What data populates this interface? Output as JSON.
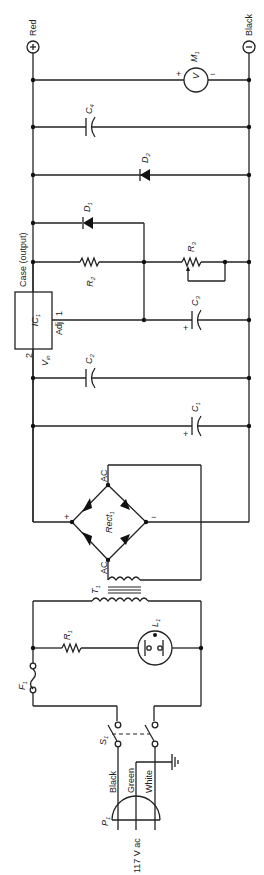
{
  "diagram": {
    "type": "circuit-schematic",
    "orientation": "rotated-90-ccw",
    "terminals": {
      "positive": {
        "symbol": "+",
        "label": "Red"
      },
      "negative": {
        "symbol": "−",
        "label": "Black"
      }
    },
    "components": {
      "M1": {
        "ref": "M",
        "sub": "1",
        "glyph": "V",
        "plus": "+",
        "minus": "−"
      },
      "C4": {
        "ref": "C",
        "sub": "4"
      },
      "D2": {
        "ref": "D",
        "sub": "2"
      },
      "D1": {
        "ref": "D",
        "sub": "1"
      },
      "R2": {
        "ref": "R",
        "sub": "2"
      },
      "R3": {
        "ref": "R",
        "sub": "3"
      },
      "C3": {
        "ref": "C",
        "sub": "3",
        "polarity": "+"
      },
      "C2": {
        "ref": "C",
        "sub": "2"
      },
      "C1": {
        "ref": "C",
        "sub": "1",
        "polarity": "+"
      },
      "IC1": {
        "ref": "IC",
        "sub": "1",
        "case_label": "Case (output)",
        "adj_label": "Adj",
        "adj_pin": "1",
        "vin_label": "V",
        "vin_sub": "in",
        "vin_pin": "2"
      },
      "Rect1": {
        "ref": "Rect",
        "sub": "1",
        "ac_top": "AC",
        "ac_bottom": "AC",
        "plus": "+",
        "minus": "−"
      },
      "T1": {
        "ref": "T",
        "sub": "1"
      },
      "R1": {
        "ref": "R",
        "sub": "1"
      },
      "L1": {
        "ref": "L",
        "sub": "1"
      },
      "F1": {
        "ref": "F",
        "sub": "1"
      },
      "S1": {
        "ref": "S",
        "sub": "1"
      },
      "P1": {
        "ref": "P",
        "sub": "1",
        "wires": [
          "Black",
          "Green",
          "White"
        ],
        "supply": "117 V ac"
      }
    }
  }
}
